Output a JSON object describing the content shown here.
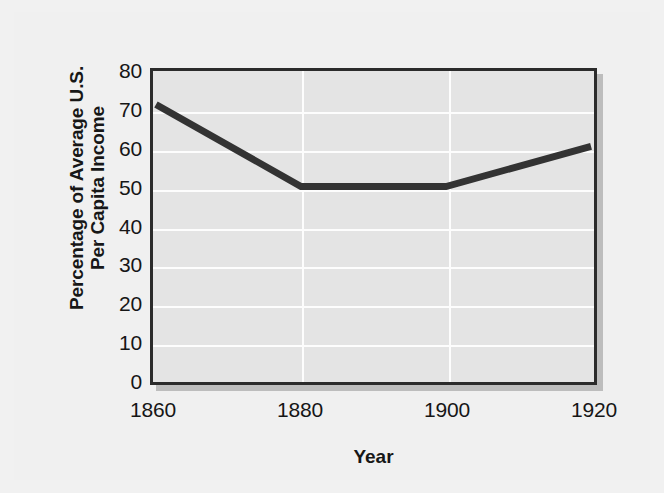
{
  "chart_data": {
    "type": "line",
    "title": "",
    "subtitle": "",
    "xlabel": "Year",
    "ylabel": "Percentage of Average U.S. Per Capita Income",
    "ylabel_lines": [
      "Percentage of Average U.S.",
      "Per Capita Income"
    ],
    "x": [
      1860,
      1880,
      1900,
      1920
    ],
    "values": [
      72,
      50.5,
      50.5,
      61
    ],
    "series": [
      {
        "name": "Percentage of Average U.S. Per Capita Income",
        "values": [
          72,
          50.5,
          50.5,
          61
        ]
      }
    ],
    "xlim": [
      1860,
      1920
    ],
    "ylim": [
      0,
      80
    ],
    "xticks": [
      1860,
      1880,
      1900,
      1920
    ],
    "xticklabels": [
      "1860",
      "1880",
      "1900",
      "1920"
    ],
    "yticks": [
      0,
      10,
      20,
      30,
      40,
      50,
      60,
      70,
      80
    ],
    "yticklabels": [
      "0",
      "10",
      "20",
      "30",
      "40",
      "50",
      "60",
      "70",
      "80"
    ],
    "grid": true,
    "grid_color": "#fdfdfd",
    "legend": false,
    "legend_position": "none",
    "line_color": "#333333",
    "plot_background": "#e4e4e4",
    "figure_background": "#f0f0f0",
    "frame_color": "#2b2b2b",
    "text_color": "#161616",
    "annotations": []
  },
  "axes": {
    "y_title_line1": "Percentage of Average U.S.",
    "y_title_line2": "Per Capita Income",
    "x_title": "Year"
  }
}
